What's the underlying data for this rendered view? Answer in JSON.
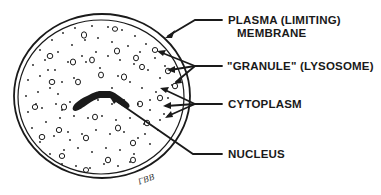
{
  "diagram": {
    "labels": {
      "plasma_membrane_line1": "PLASMA (LIMITING)",
      "plasma_membrane_line2": "MEMBRANE",
      "granule": "\"GRANULE\" (LYSOSOME)",
      "cytoplasm": "CYTOPLASM",
      "nucleus": "NUCLEUS"
    },
    "signature": "ГВВ",
    "colors": {
      "ink": "#1a1a1a",
      "background": "#ffffff"
    }
  }
}
